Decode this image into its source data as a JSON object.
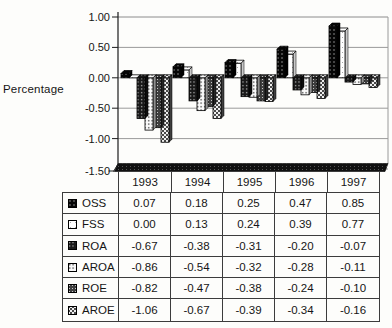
{
  "page": {
    "background": "#fdfdfb"
  },
  "chart_data": {
    "type": "bar",
    "style": "3d-clustered-column-with-data-table",
    "title": "",
    "xlabel": "",
    "ylabel": "Percentage",
    "categories": [
      "1993",
      "1994",
      "1995",
      "1996",
      "1997"
    ],
    "series": [
      {
        "name": "OSS",
        "values": [
          0.07,
          0.18,
          0.25,
          0.47,
          0.85
        ],
        "pattern": "black-white-dots"
      },
      {
        "name": "FSS",
        "values": [
          0.0,
          0.13,
          0.24,
          0.39,
          0.77
        ],
        "pattern": "white-speckle"
      },
      {
        "name": "ROA",
        "values": [
          -0.67,
          -0.38,
          -0.31,
          -0.2,
          -0.07
        ],
        "pattern": "dark-white-dots"
      },
      {
        "name": "AROA",
        "values": [
          -0.86,
          -0.54,
          -0.32,
          -0.28,
          -0.11
        ],
        "pattern": "light-dark-dots"
      },
      {
        "name": "ROE",
        "values": [
          -0.82,
          -0.47,
          -0.38,
          -0.24,
          -0.1
        ],
        "pattern": "gray-white-dots"
      },
      {
        "name": "AROE",
        "values": [
          -1.06,
          -0.67,
          -0.39,
          -0.34,
          -0.16
        ],
        "pattern": "gray-checker"
      }
    ],
    "ylim": [
      -1.5,
      1.0
    ],
    "y_ticks": [
      1.0,
      0.5,
      0.0,
      -0.5,
      -1.0,
      -1.5
    ],
    "y_tick_labels": [
      "1.00",
      "0.50",
      "0.00",
      "-0.50",
      "-1.00",
      "-1.50"
    ],
    "grid": true,
    "legend_position": "data-table-left-column"
  },
  "data_table": {
    "column_headers": [
      "1993",
      "1994",
      "1995",
      "1996",
      "1997"
    ],
    "rows": [
      {
        "label": "OSS",
        "cells": [
          "0.07",
          "0.18",
          "0.25",
          "0.47",
          "0.85"
        ]
      },
      {
        "label": "FSS",
        "cells": [
          "0.00",
          "0.13",
          "0.24",
          "0.39",
          "0.77"
        ]
      },
      {
        "label": "ROA",
        "cells": [
          "-0.67",
          "-0.38",
          "-0.31",
          "-0.20",
          "-0.07"
        ]
      },
      {
        "label": "AROA",
        "cells": [
          "-0.86",
          "-0.54",
          "-0.32",
          "-0.28",
          "-0.11"
        ]
      },
      {
        "label": "ROE",
        "cells": [
          "-0.82",
          "-0.47",
          "-0.38",
          "-0.24",
          "-0.10"
        ]
      },
      {
        "label": "AROE",
        "cells": [
          "-1.06",
          "-0.67",
          "-0.39",
          "-0.34",
          "-0.16"
        ]
      }
    ]
  },
  "colors": {
    "grid_line": "#9a9a9a",
    "plot_border": "#8c8c8c",
    "axis_line": "#1c1c1c",
    "table_border": "#3c3c3c",
    "text": "#151515",
    "floor": "#101010",
    "bar_outline": "#000000"
  }
}
